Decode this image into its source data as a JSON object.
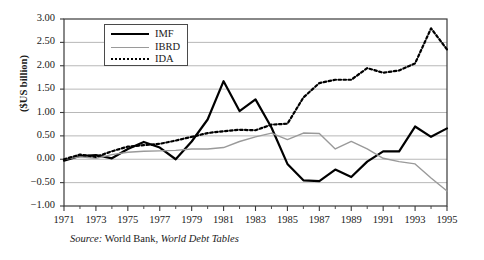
{
  "figure": {
    "ylabel": "($US billion)",
    "source_prefix": "Source:",
    "source_mid": " World Bank, ",
    "source_italic": "World Debt Tables"
  },
  "legend": {
    "position": "inside-top-left",
    "items": [
      {
        "label": "IMF",
        "style": "solid",
        "color": "#000000"
      },
      {
        "label": "IBRD",
        "style": "solid",
        "color": "#9a9a9a"
      },
      {
        "label": "IDA",
        "style": "dotted",
        "color": "#000000"
      }
    ]
  },
  "chart_data": {
    "type": "line",
    "title": "",
    "xlabel": "",
    "ylabel": "($US billion)",
    "xlim": [
      1971,
      1995
    ],
    "ylim": [
      -1.0,
      3.0
    ],
    "grid": true,
    "grid_axis": "y",
    "legend_position": "inside-top-left",
    "x": [
      1971,
      1972,
      1973,
      1974,
      1975,
      1976,
      1977,
      1978,
      1979,
      1980,
      1981,
      1982,
      1983,
      1984,
      1985,
      1986,
      1987,
      1988,
      1989,
      1990,
      1991,
      1992,
      1993,
      1994,
      1995
    ],
    "ytick_labels": [
      "3.00",
      "2.50",
      "2.00",
      "1.50",
      "1.00",
      "0.50",
      "0.00",
      "-0.50",
      "-1.00"
    ],
    "ytick_values": [
      3.0,
      2.5,
      2.0,
      1.5,
      1.0,
      0.5,
      0.0,
      -0.5,
      -1.0
    ],
    "xtick_labels": [
      "1971",
      "1973",
      "1975",
      "1977",
      "1979",
      "1981",
      "1983",
      "1985",
      "1987",
      "1989",
      "1991",
      "1993",
      "1995"
    ],
    "xtick_values": [
      1971,
      1973,
      1975,
      1977,
      1979,
      1981,
      1983,
      1985,
      1987,
      1989,
      1991,
      1993,
      1995
    ],
    "minor_xtick_values": [
      1972,
      1974,
      1976,
      1978,
      1980,
      1982,
      1984,
      1986,
      1988,
      1990,
      1992,
      1994
    ],
    "series": [
      {
        "name": "IMF",
        "color": "#000000",
        "style": "solid",
        "width": 2.2,
        "values": [
          -0.03,
          0.07,
          0.09,
          0.02,
          0.22,
          0.37,
          0.25,
          0.0,
          0.38,
          0.85,
          1.67,
          1.03,
          1.28,
          0.68,
          -0.1,
          -0.45,
          -0.47,
          -0.22,
          -0.38,
          -0.05,
          0.17,
          0.17,
          0.7,
          0.48,
          0.66
        ]
      },
      {
        "name": "IBRD",
        "color": "#9a9a9a",
        "style": "solid",
        "width": 1.4,
        "values": [
          0.0,
          0.05,
          0.02,
          0.1,
          0.15,
          0.17,
          0.18,
          0.19,
          0.22,
          0.22,
          0.25,
          0.38,
          0.48,
          0.56,
          0.42,
          0.56,
          0.55,
          0.22,
          0.38,
          0.22,
          0.02,
          -0.05,
          -0.1,
          -0.4,
          -0.68
        ]
      },
      {
        "name": "IDA",
        "color": "#000000",
        "style": "dotted",
        "width": 2.2,
        "values": [
          0.0,
          0.1,
          0.05,
          0.17,
          0.27,
          0.3,
          0.33,
          0.4,
          0.48,
          0.56,
          0.6,
          0.63,
          0.62,
          0.74,
          0.76,
          1.32,
          1.63,
          1.7,
          1.7,
          1.95,
          1.85,
          1.9,
          2.05,
          2.8,
          2.35
        ]
      }
    ]
  }
}
